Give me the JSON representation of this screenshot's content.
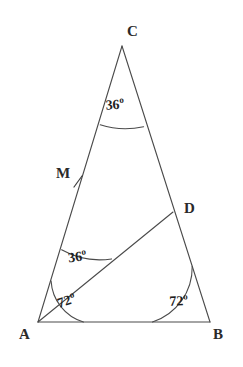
{
  "figure": {
    "stroke_color": "#4a4a4a",
    "text_color": "#1f1f1f",
    "background_color": "#ffffff",
    "degree_symbol": "o"
  },
  "vertices": [
    {
      "id": "C",
      "label": "C",
      "x": 122,
      "y": 46,
      "label_x": 127,
      "label_y": 24
    },
    {
      "id": "A",
      "label": "A",
      "x": 38,
      "y": 322,
      "label_x": 19,
      "label_y": 327
    },
    {
      "id": "B",
      "label": "B",
      "x": 210,
      "y": 322,
      "label_x": 213,
      "label_y": 327
    },
    {
      "id": "D",
      "label": "D",
      "x": 173,
      "y": 212,
      "label_x": 184,
      "label_y": 201
    },
    {
      "id": "M",
      "label": "M",
      "x": 79,
      "y": 182,
      "label_x": 56,
      "label_y": 166
    }
  ],
  "segments": [
    {
      "name": "side-AC",
      "from": "A",
      "to": "C"
    },
    {
      "name": "side-CB",
      "from": "C",
      "to": "B"
    },
    {
      "name": "side-AB",
      "from": "A",
      "to": "B"
    },
    {
      "name": "cevian-AD",
      "from": "A",
      "to": "D"
    }
  ],
  "angles": [
    {
      "name": "angle-at-C",
      "vertex": "C",
      "value": "36",
      "unit": "o",
      "text": "36o"
    },
    {
      "name": "angle-CAD",
      "vertex": "A",
      "value": "36",
      "unit": "o",
      "text": "36o"
    },
    {
      "name": "angle-DAB",
      "vertex": "A",
      "value": "72",
      "unit": "o",
      "text": "72o"
    },
    {
      "name": "angle-at-B",
      "vertex": "B",
      "value": "72",
      "unit": "o",
      "text": "72o"
    }
  ],
  "labels": {
    "c_vertex": "C",
    "a_vertex": "A",
    "b_vertex": "B",
    "d_vertex": "D",
    "m_point": "M",
    "angle_c": "36",
    "angle_cad": "36",
    "angle_dab": "72",
    "angle_b": "72",
    "deg": "o"
  }
}
